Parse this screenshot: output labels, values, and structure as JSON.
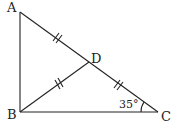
{
  "diagram": {
    "type": "geometry-triangle",
    "points": {
      "A": {
        "label": "A",
        "x": 20,
        "y": 12
      },
      "B": {
        "label": "B",
        "x": 20,
        "y": 112
      },
      "C": {
        "label": "C",
        "x": 158,
        "y": 112
      },
      "D": {
        "label": "D",
        "x": 89,
        "y": 62
      }
    },
    "segments": [
      "AB",
      "BC",
      "CA",
      "BD"
    ],
    "equal_marks": [
      "AD",
      "BD",
      "DC"
    ],
    "angle": {
      "vertex": "C",
      "label": "35°"
    },
    "colors": {
      "stroke": "#222222",
      "background": "#ffffff"
    }
  }
}
